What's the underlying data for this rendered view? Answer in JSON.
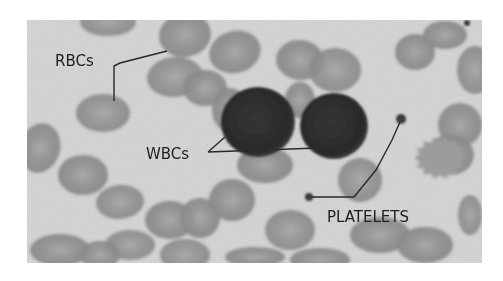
{
  "figure": {
    "labels": {
      "rbc": "RBCs",
      "wbc": "WBCs",
      "platelets": "PLATELETS"
    },
    "colors": {
      "background": "#d6d6d6",
      "rbc": "#8e8e8e",
      "rbc_light": "#9c9c9c",
      "wbc": "#2e2e2e",
      "platelet": "#3a3a3a",
      "leader_line": "#2a2a2a",
      "label_text": "#1e1e1e",
      "page": "#ffffff"
    }
  }
}
